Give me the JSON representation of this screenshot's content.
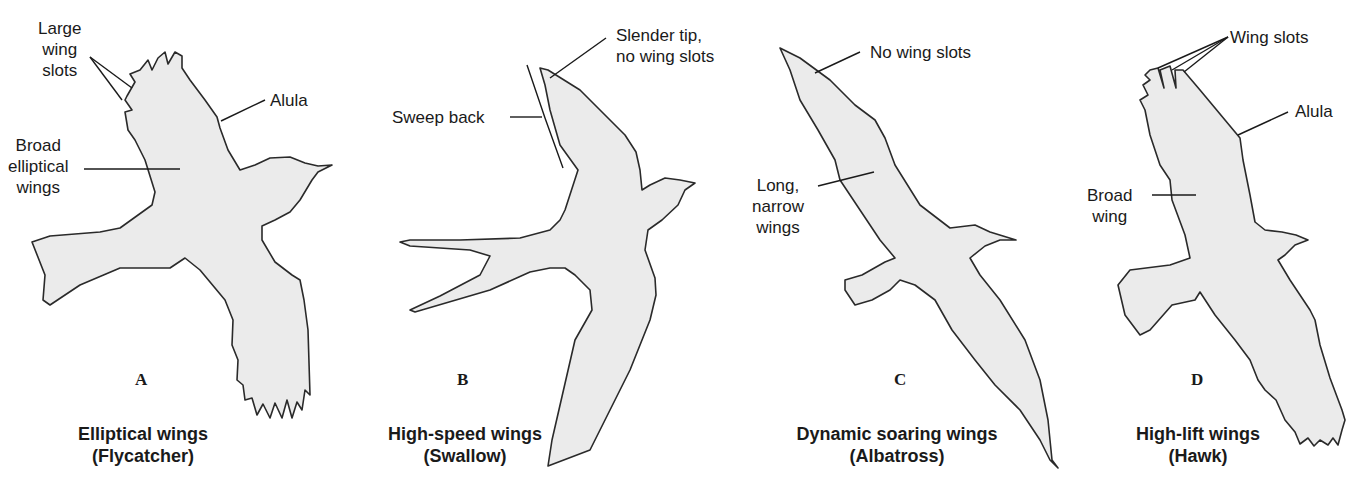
{
  "figure": {
    "panels": [
      {
        "letter": "A",
        "title": "Elliptical wings",
        "subtitle": "(Flycatcher)",
        "labels": {
          "large_wing_slots": "Large\nwing\nslots",
          "alula": "Alula",
          "broad_elliptical_wings": "Broad\nelliptical\nwings"
        }
      },
      {
        "letter": "B",
        "title": "High-speed wings",
        "subtitle": "(Swallow)",
        "labels": {
          "slender_tip": "Slender tip,\nno wing slots",
          "sweep_back": "Sweep back"
        }
      },
      {
        "letter": "C",
        "title": "Dynamic soaring wings",
        "subtitle": "(Albatross)",
        "labels": {
          "no_wing_slots": "No wing slots",
          "long_narrow_wings": "Long,\nnarrow\nwings"
        }
      },
      {
        "letter": "D",
        "title": "High-lift wings",
        "subtitle": "(Hawk)",
        "labels": {
          "wing_slots": "Wing slots",
          "alula": "Alula",
          "broad_wing": "Broad\nwing"
        }
      }
    ],
    "colors": {
      "silhouette_fill": "#ebebeb",
      "outline": "#2a2a2a",
      "background": "#ffffff"
    }
  }
}
